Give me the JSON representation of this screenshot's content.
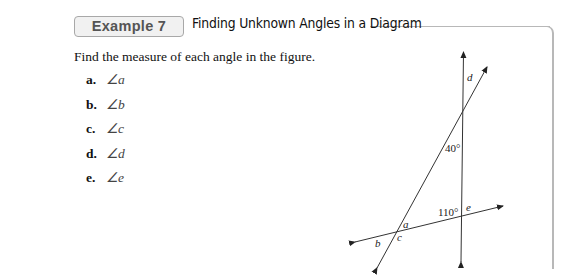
{
  "header": {
    "badge": "Example 7",
    "title": "Finding Unknown Angles in a Diagram"
  },
  "prompt": "Find the measure of each angle in the figure.",
  "items": [
    {
      "label": "a.",
      "angle": "∠a"
    },
    {
      "label": "b.",
      "angle": "∠b"
    },
    {
      "label": "c.",
      "angle": "∠c"
    },
    {
      "label": "d.",
      "angle": "∠d"
    },
    {
      "label": "e.",
      "angle": "∠e"
    }
  ],
  "figure": {
    "angle_labels": {
      "d": "d",
      "forty": "40°",
      "one_ten": "110°",
      "e": "e",
      "a": "a",
      "b": "b",
      "c": "c"
    }
  }
}
